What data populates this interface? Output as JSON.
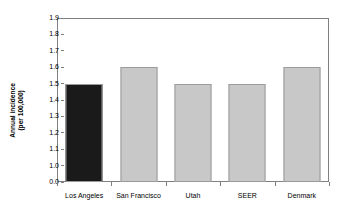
{
  "chart_data": {
    "type": "bar",
    "title": "",
    "xlabel": "",
    "ylabel": "Annual incidence (per 100,000)",
    "ylabel_line1": "Annual incidence",
    "ylabel_line2": "(per 100,000)",
    "categories": [
      "Los Angeles",
      "San Francisco",
      "Utah",
      "SEER",
      "Denmark"
    ],
    "values": [
      1.5,
      1.6,
      1.5,
      1.5,
      1.6
    ],
    "ylim": [
      0.0,
      1.9
    ],
    "axis_break": true,
    "axis_break_note": "Y axis jumps from 0.0 to 1.0",
    "ytick_labels": [
      "1.9",
      "1.8",
      "1.7",
      "1.6",
      "1.5",
      "1.4",
      "1.3",
      "1.2",
      "1.1",
      "1.0",
      "0.0"
    ],
    "ytick_values": [
      1.9,
      1.8,
      1.7,
      1.6,
      1.5,
      1.4,
      1.3,
      1.2,
      1.1,
      1.0,
      0.0
    ],
    "grid": false,
    "legend": "none",
    "bar_colors": [
      "#1a1a1a",
      "#c8c8c8",
      "#c8c8c8",
      "#c8c8c8",
      "#c8c8c8"
    ],
    "bar_border_color": "#9a9a9a",
    "axis_color": "#808080",
    "background_color": "#ffffff",
    "highlight_category": "Los Angeles"
  }
}
